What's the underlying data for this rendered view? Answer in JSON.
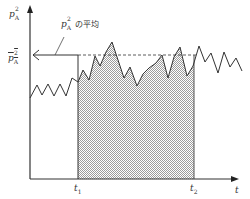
{
  "diagram": {
    "y_axis_label": "p",
    "y_axis_sub": "A",
    "y_axis_sup": "2",
    "x_axis_label": "t",
    "mean_label_symbol": "p",
    "mean_label_sub": "A",
    "mean_label_sup": "2",
    "annotation_symbol": "p",
    "annotation_sub": "A",
    "annotation_sup": "2",
    "annotation_text": "の平均",
    "t1_label": "t",
    "t1_sub": "1",
    "t2_label": "t",
    "t2_sub": "2",
    "colors": {
      "line": "#333333",
      "fill": "#d6d6d6",
      "background": "#ffffff"
    },
    "waveform_points": "30,98 37,85 42,95 48,84 54,96 60,84 66,96 72,78 78,82 83,70 89,80 95,56 100,66 106,52 112,42 118,60 124,78 130,67 137,86 143,74 149,68 156,63 162,55 168,78 174,57 180,47 187,76 193,66 199,46 205,62 211,53 218,73 224,52 230,67 236,58 242,71"
  }
}
